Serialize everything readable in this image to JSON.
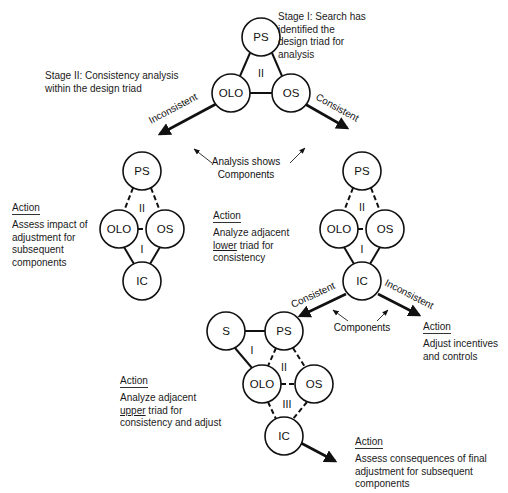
{
  "stage1": {
    "lines": [
      "Stage I:  Search has",
      "identified the",
      "design triad for",
      "analysis"
    ]
  },
  "stage2": {
    "lines": [
      "Stage II:  Consistency analysis",
      "within the design triad"
    ]
  },
  "top_triad": {
    "nodes": {
      "ps": "PS",
      "olo": "OLO",
      "os": "OS"
    },
    "region": "II"
  },
  "branch_top": {
    "left_label": "Inconsistent",
    "right_label": "Consistent",
    "annotation": [
      "Analysis shows",
      "Components"
    ]
  },
  "left_diamond": {
    "nodes": {
      "ps": "PS",
      "olo": "OLO",
      "os": "OS",
      "ic": "IC"
    },
    "regions": [
      "II",
      "I"
    ],
    "action": {
      "title": "Action",
      "lines": [
        "Assess impact of",
        "adjustment for",
        "subsequent",
        "components"
      ]
    }
  },
  "middle_action": {
    "title": "Action",
    "line1": "Analyze adjacent",
    "line2_underlined": "lower",
    "line2_rest": " triad for",
    "line3": "consistency"
  },
  "right_diamond": {
    "nodes": {
      "ps": "PS",
      "olo": "OLO",
      "os": "OS",
      "ic": "IC"
    },
    "regions": [
      "II",
      "I"
    ],
    "left_label": "Consistent",
    "right_label": "Inconsistent",
    "annotation": "Components"
  },
  "right_action": {
    "title": "Action",
    "lines": [
      "Adjust incentives",
      "and controls"
    ]
  },
  "bottom_group": {
    "nodes": {
      "s": "S",
      "ps": "PS",
      "olo": "OLO",
      "os": "OS",
      "ic": "IC"
    },
    "regions": [
      "I",
      "II",
      "III"
    ]
  },
  "bottom_left_action": {
    "title": "Action",
    "line1": "Analyze adjacent",
    "line2_underlined": "upper",
    "line2_rest": " triad for",
    "line3": "consistency and adjust"
  },
  "bottom_right_action": {
    "title": "Action",
    "lines": [
      "Assess consequences of final",
      "adjustment for subsequent",
      "components"
    ]
  }
}
